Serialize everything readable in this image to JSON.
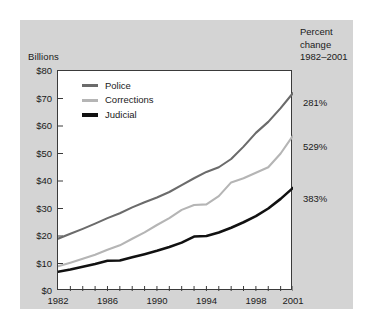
{
  "figure": {
    "panel_background": "#d4d4d4",
    "plot_background": "#ffffff",
    "plot_border_color": "#3a3a3a"
  },
  "axis": {
    "y_unit_label": "Billions",
    "y_ticks": [
      "$0",
      "$10",
      "$20",
      "$30",
      "$40",
      "$50",
      "$60",
      "$70",
      "$80"
    ],
    "x_ticks": [
      "1982",
      "1986",
      "1990",
      "1994",
      "1998",
      "2001"
    ]
  },
  "legend": {
    "items": [
      {
        "label": "Police",
        "color": "#6b6b6b"
      },
      {
        "label": "Corrections",
        "color": "#b5b5b5"
      },
      {
        "label": "Judicial",
        "color": "#111111"
      }
    ]
  },
  "percent_change": {
    "header_line1": "Percent",
    "header_line2": "change",
    "header_line3": "1982–2001",
    "values": [
      {
        "series": "Police",
        "value": "281%"
      },
      {
        "series": "Corrections",
        "value": "529%"
      },
      {
        "series": "Judicial",
        "value": "383%"
      }
    ]
  },
  "chart_data": {
    "type": "line",
    "title": "",
    "subtitle": "",
    "xlabel": "",
    "ylabel": "Billions",
    "xlim": [
      1982,
      2001
    ],
    "ylim": [
      0,
      80
    ],
    "grid": false,
    "legend_position": "top-left inside plot",
    "y_tick_values": [
      0,
      10,
      20,
      30,
      40,
      50,
      60,
      70,
      80
    ],
    "y_tick_labels": [
      "$0",
      "$10",
      "$20",
      "$30",
      "$40",
      "$50",
      "$60",
      "$70",
      "$80"
    ],
    "x": [
      1982,
      1983,
      1984,
      1985,
      1986,
      1987,
      1988,
      1989,
      1990,
      1991,
      1992,
      1993,
      1994,
      1995,
      1996,
      1997,
      1998,
      1999,
      2000,
      2001
    ],
    "x_tick_labels": [
      "1982",
      "1986",
      "1990",
      "1994",
      "1998",
      "2001"
    ],
    "x_tick_values": [
      1982,
      1986,
      1990,
      1994,
      1998,
      2001
    ],
    "series": [
      {
        "name": "Police",
        "color": "#6b6b6b",
        "percent_change_1982_2001": "281%",
        "values": [
          19.0,
          20.8,
          22.6,
          24.5,
          26.5,
          28.3,
          30.4,
          32.3,
          34.0,
          36.0,
          38.5,
          41.0,
          43.3,
          45.0,
          48.0,
          52.5,
          57.5,
          61.5,
          66.5,
          72.0
        ]
      },
      {
        "name": "Corrections",
        "color": "#b5b5b5",
        "percent_change_1982_2001": "529%",
        "values": [
          9.0,
          10.3,
          11.7,
          13.2,
          15.0,
          16.6,
          19.0,
          21.3,
          24.0,
          26.5,
          29.5,
          31.3,
          31.5,
          34.5,
          39.5,
          41.0,
          43.0,
          45.0,
          50.0,
          56.5
        ]
      },
      {
        "name": "Judicial",
        "color": "#111111",
        "percent_change_1982_2001": "383%",
        "values": [
          7.0,
          7.8,
          8.8,
          9.8,
          11.0,
          11.1,
          12.3,
          13.4,
          14.6,
          16.0,
          17.6,
          19.8,
          20.0,
          21.3,
          23.0,
          25.0,
          27.2,
          30.0,
          33.5,
          37.5
        ]
      }
    ]
  }
}
